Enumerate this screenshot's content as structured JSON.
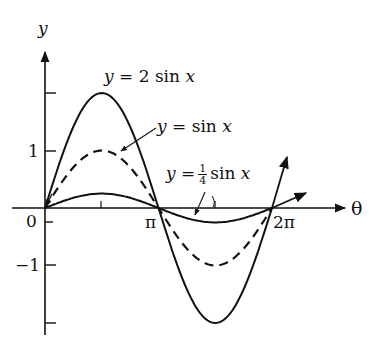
{
  "chart_data": {
    "type": "line",
    "title": "",
    "xlabel": "θ",
    "ylabel": "y",
    "x_ticks": [
      "0",
      "π",
      "2π"
    ],
    "y_ticks": [
      "1",
      "-1"
    ],
    "xlim": [
      0,
      6.2832
    ],
    "ylim": [
      -2,
      2
    ],
    "grid": false,
    "legend": "inline annotations with arrows",
    "series": [
      {
        "name": "y = 2 sin x",
        "style": "solid",
        "amplitude": 2,
        "x": [
          0,
          0.7854,
          1.5708,
          2.3562,
          3.1416,
          3.927,
          4.7124,
          5.4978,
          6.2832
        ],
        "values": [
          0,
          1.414,
          2,
          1.414,
          0,
          -1.414,
          -2,
          -1.414,
          0
        ]
      },
      {
        "name": "y = sin x",
        "style": "dashed",
        "amplitude": 1,
        "x": [
          0,
          0.7854,
          1.5708,
          2.3562,
          3.1416,
          3.927,
          4.7124,
          5.4978,
          6.2832
        ],
        "values": [
          0,
          0.707,
          1,
          0.707,
          0,
          -0.707,
          -1,
          -0.707,
          0
        ]
      },
      {
        "name": "y = 1/4 sin x",
        "style": "solid",
        "amplitude": 0.25,
        "x": [
          0,
          0.7854,
          1.5708,
          2.3562,
          3.1416,
          3.927,
          4.7124,
          5.4978,
          6.2832
        ],
        "values": [
          0,
          0.177,
          0.25,
          0.177,
          0,
          -0.177,
          -0.25,
          -0.177,
          0
        ]
      }
    ]
  },
  "labels": {
    "y_axis": "y",
    "x_axis": "θ",
    "tick_0": "0",
    "tick_pi": "π",
    "tick_2pi": "2π",
    "tick_1": "1",
    "tick_neg1": "−1",
    "series_2sin": {
      "y": "y",
      "eq": "= 2 sin",
      "x": "x"
    },
    "series_sin": {
      "y": "y",
      "eq": "= sin",
      "x": "x"
    },
    "series_quarter": {
      "y": "y",
      "eq": "=",
      "num": "1",
      "den": "4",
      "fn": "sin",
      "x": "x"
    }
  }
}
